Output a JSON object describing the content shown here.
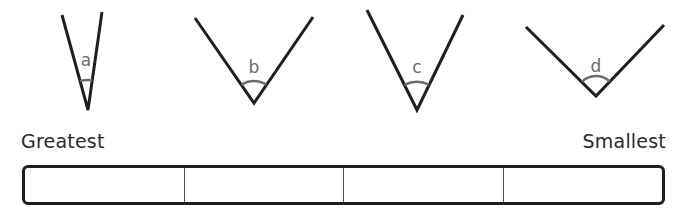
{
  "angles": [
    {
      "label": "a",
      "left": [
        62,
        15
      ],
      "vertex": [
        88,
        110
      ],
      "right": [
        102,
        12
      ],
      "label_pos": [
        86,
        66
      ],
      "arc_radius": 30
    },
    {
      "label": "b",
      "left": [
        195,
        18
      ],
      "vertex": [
        254,
        103
      ],
      "right": [
        313,
        17
      ],
      "label_pos": [
        254,
        73
      ],
      "arc_radius": 22
    },
    {
      "label": "c",
      "left": [
        367,
        10
      ],
      "vertex": [
        417,
        110
      ],
      "right": [
        463,
        15
      ],
      "label_pos": [
        417,
        73
      ],
      "arc_radius": 28
    },
    {
      "label": "d",
      "left": [
        526,
        27
      ],
      "vertex": [
        596,
        96
      ],
      "right": [
        664,
        25
      ],
      "label_pos": [
        596,
        72
      ],
      "arc_radius": 20
    }
  ],
  "scale": {
    "left_label": "Greatest",
    "right_label": "Smallest",
    "cells": [
      "",
      "",
      "",
      ""
    ]
  },
  "colors": {
    "line": "#1f1f1f",
    "arc": "#6b6b6b",
    "angle_label": "#6b6b6b",
    "text": "#2b2b2b"
  }
}
